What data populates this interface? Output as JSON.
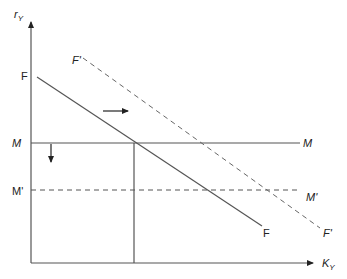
{
  "diagram": {
    "type": "economics-shift-diagram",
    "axes": {
      "y_label": "r",
      "y_label_sub": "Y",
      "x_label": "K",
      "x_label_sub": "Y"
    },
    "curves": [
      {
        "id": "F",
        "style": "solid",
        "label_start": "F",
        "label_end": "F",
        "slope": "downward"
      },
      {
        "id": "F_prime",
        "style": "dashed",
        "label_start": "F'",
        "label_end": "F'",
        "slope": "downward"
      },
      {
        "id": "M",
        "style": "solid",
        "label_start": "M",
        "label_end": "M",
        "slope": "horizontal"
      },
      {
        "id": "M_prime",
        "style": "dashed",
        "label_start": "M'",
        "label_end": "M'",
        "slope": "horizontal"
      }
    ],
    "arrows": [
      {
        "id": "shift-right",
        "direction": "right",
        "meaning": "F shifts to F'"
      },
      {
        "id": "shift-down",
        "direction": "down",
        "meaning": "M shifts to M'"
      }
    ],
    "labels": {
      "F_left": "F",
      "F_right": "F",
      "Fp_left": "F'",
      "Fp_right": "F'",
      "M_left": "M",
      "M_right": "M",
      "Mp_left": "M'",
      "Mp_right": "M'"
    }
  }
}
